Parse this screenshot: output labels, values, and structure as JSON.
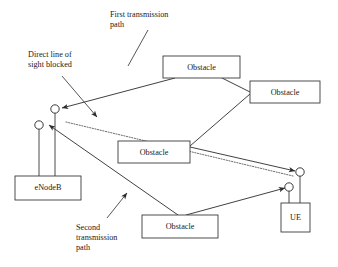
{
  "diagram": {
    "annotations": {
      "first_path_line1": "First transmission",
      "first_path_line2": "path",
      "blocked_line1": "Direct line of",
      "blocked_line2": "sight blocked",
      "second_path_line1": "Second",
      "second_path_line2": "transmission",
      "second_path_line3": "path"
    },
    "nodes": {
      "enodeb": "eNodeB",
      "ue": "UE"
    },
    "obstacles": [
      {
        "label": "Obstacle",
        "x": 163,
        "y": 56,
        "w": 77,
        "h": 22
      },
      {
        "label": "Obstacle",
        "x": 250,
        "y": 81,
        "w": 70,
        "h": 22
      },
      {
        "label": "Obstacle",
        "x": 118,
        "y": 141,
        "w": 72,
        "h": 22
      },
      {
        "label": "Obstacle",
        "x": 142,
        "y": 215,
        "w": 76,
        "h": 23
      }
    ],
    "colors": {
      "stroke": "#2b2b2b",
      "box_stroke": "#3a3a3a",
      "dotted": "#5a5a5a",
      "text": "#1a1a1a",
      "background": "#ffffff"
    },
    "legend": {
      "first_path_desc": "eNodeB upper antenna to Obstacle 1 to Obstacle 2 to Obstacle 3 to UE upper antenna",
      "second_path_desc": "eNodeB lower antenna to Obstacle 4 to UE lower antenna",
      "blocked_desc": "dotted direct line from eNodeB to UE is blocked"
    }
  }
}
